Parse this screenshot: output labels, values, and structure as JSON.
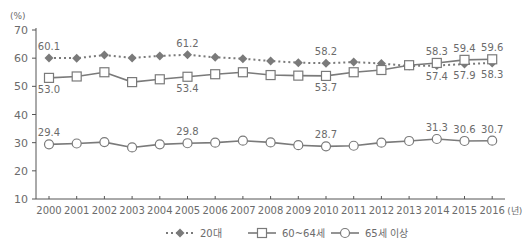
{
  "chart_data": {
    "type": "line",
    "title": "",
    "xlabel": "(년)",
    "ylabel": "(%)",
    "ylim": [
      10,
      70
    ],
    "yticks": [
      10,
      20,
      30,
      40,
      50,
      60,
      70
    ],
    "grid": false,
    "legend_position": "bottom",
    "categories": [
      "2000",
      "2001",
      "2002",
      "2003",
      "2004",
      "2005",
      "2006",
      "2007",
      "2008",
      "2009",
      "2010",
      "2011",
      "2012",
      "2013",
      "2014",
      "2015",
      "2016"
    ],
    "series": [
      {
        "name": "20대",
        "marker": "diamond",
        "line": "dotted",
        "values": [
          60.1,
          60.0,
          61.1,
          60.1,
          60.8,
          61.2,
          60.3,
          59.8,
          59.0,
          58.4,
          58.2,
          58.6,
          58.1,
          57.2,
          57.4,
          57.9,
          58.3
        ],
        "labels": {
          "0": "60.1",
          "5": "61.2",
          "10": "58.2",
          "14": "57.4",
          "15": "57.9",
          "16": "58.3"
        },
        "label_pos": {
          "0": "above",
          "5": "above",
          "10": "above",
          "14": "below",
          "15": "below",
          "16": "below"
        }
      },
      {
        "name": "60~64세",
        "marker": "square",
        "line": "solid",
        "values": [
          53.0,
          53.5,
          55.0,
          51.5,
          52.5,
          53.4,
          54.3,
          55.0,
          54.0,
          53.8,
          53.7,
          55.0,
          55.8,
          57.5,
          58.3,
          59.4,
          59.6
        ],
        "labels": {
          "0": "53.0",
          "5": "53.4",
          "10": "53.7",
          "14": "58.3",
          "15": "59.4",
          "16": "59.6"
        },
        "label_pos": {
          "0": "below",
          "5": "below",
          "10": "below",
          "14": "above",
          "15": "above",
          "16": "above"
        }
      },
      {
        "name": "65세 이상",
        "marker": "circle",
        "line": "solid",
        "values": [
          29.4,
          29.7,
          30.2,
          28.3,
          29.4,
          29.8,
          30.0,
          30.7,
          30.1,
          29.1,
          28.7,
          28.9,
          30.0,
          30.6,
          31.3,
          30.6,
          30.7
        ],
        "labels": {
          "0": "29.4",
          "5": "29.8",
          "10": "28.7",
          "14": "31.3",
          "15": "30.6",
          "16": "30.7"
        },
        "label_pos": {
          "0": "above",
          "5": "above",
          "10": "above",
          "14": "above",
          "15": "above",
          "16": "above"
        }
      }
    ]
  },
  "colors": {
    "axis": "#555555",
    "text": "#6b6b6b",
    "series_line": "#7a7a7a",
    "marker_fill_diamond": "#7a7a7a",
    "marker_fill_open": "#ffffff"
  }
}
